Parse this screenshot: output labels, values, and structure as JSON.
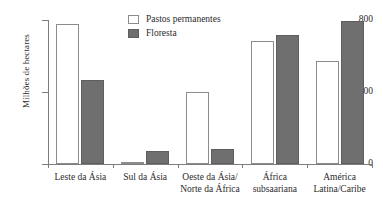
{
  "chart_data": {
    "type": "bar",
    "title": "",
    "xlabel": "",
    "ylabel": "Milhões de hectares",
    "ylim": [
      0,
      800
    ],
    "yticks": [
      0,
      400,
      800
    ],
    "ytick_labels": [
      "0",
      "400",
      "800"
    ],
    "grid": false,
    "legend_position": "top-center",
    "categories": [
      "Leste da Ásia",
      "Sul da Ásia",
      "Oeste da Ásia/\nNorte da África",
      "África\nsubsaariana",
      "América\nLatina/Caribe"
    ],
    "series": [
      {
        "name": "Pastos permanentes",
        "color": "#ffffff",
        "values": [
          780,
          10,
          400,
          685,
          570
        ]
      },
      {
        "name": "Floresta",
        "color": "#6f6f6f",
        "values": [
          465,
          72,
          85,
          715,
          795
        ]
      }
    ]
  },
  "legend": {
    "items": [
      {
        "label": "Pastos permanentes",
        "swatch": "pasture"
      },
      {
        "label": "Floresta",
        "swatch": "forest"
      }
    ]
  },
  "axis": {
    "y_title": "Milhões de hectares"
  }
}
